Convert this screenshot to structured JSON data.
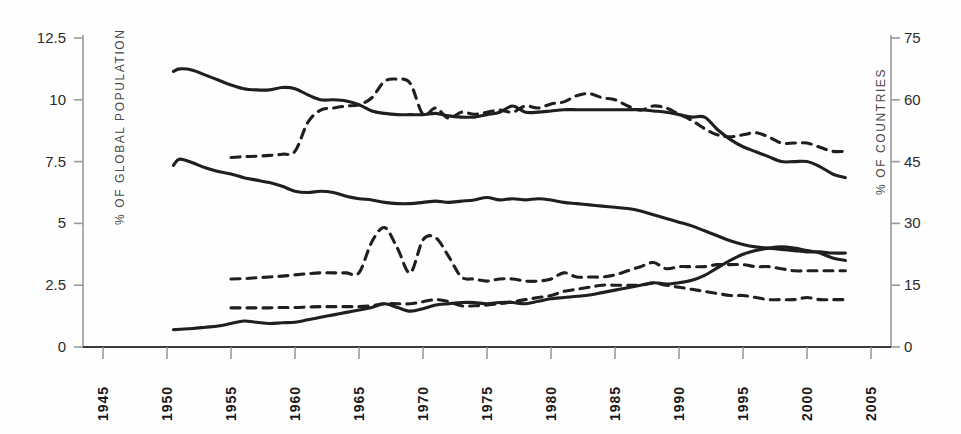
{
  "chart_data": {
    "type": "line",
    "title": "",
    "xlabel": "",
    "ylabel": "% OF GLOBAL POPULATION",
    "y2label": "% OF COUNTRIES",
    "xlim": [
      1945,
      2005
    ],
    "ylim": [
      0,
      12.5
    ],
    "y2lim": [
      0,
      75
    ],
    "grid": false,
    "legend": "none",
    "xticks": [
      "1945",
      "1950",
      "1955",
      "1960",
      "1965",
      "1970",
      "1975",
      "1980",
      "1985",
      "1990",
      "1995",
      "2000",
      "2005"
    ],
    "yticks_left": [
      "0",
      "2.5",
      "5",
      "7.5",
      "10",
      "12.5"
    ],
    "yticks_right": [
      "0",
      "15",
      "30",
      "45",
      "60",
      "75"
    ],
    "line_color": "#1f1f1f",
    "axis_color": "#9a9a9a",
    "series": [
      {
        "name": "population-upper-solid",
        "axis": "left",
        "style": "solid",
        "x": [
          1950.5,
          1951,
          1952,
          1953,
          1954,
          1955,
          1956,
          1957,
          1958,
          1959,
          1960,
          1961,
          1962,
          1963,
          1964,
          1965,
          1966,
          1967,
          1968,
          1969,
          1970,
          1971,
          1972,
          1973,
          1974,
          1975,
          1976,
          1977,
          1978,
          1979,
          1980,
          1981,
          1982,
          1983,
          1984,
          1985,
          1986,
          1987,
          1988,
          1989,
          1990,
          1991,
          1992,
          1993,
          1994,
          1995,
          1996,
          1997,
          1998,
          1999,
          2000,
          2001,
          2002,
          2003
        ],
        "values": [
          11.15,
          11.25,
          11.2,
          11.0,
          10.8,
          10.6,
          10.45,
          10.4,
          10.4,
          10.5,
          10.45,
          10.2,
          10.0,
          10.0,
          9.95,
          9.8,
          9.55,
          9.45,
          9.4,
          9.4,
          9.4,
          9.45,
          9.35,
          9.3,
          9.3,
          9.4,
          9.5,
          9.75,
          9.5,
          9.5,
          9.55,
          9.6,
          9.6,
          9.6,
          9.6,
          9.6,
          9.6,
          9.6,
          9.55,
          9.5,
          9.4,
          9.3,
          9.3,
          8.8,
          8.4,
          8.1,
          7.9,
          7.7,
          7.5,
          7.5,
          7.5,
          7.3,
          7.0,
          6.85
        ]
      },
      {
        "name": "population-middle-solid",
        "axis": "left",
        "style": "solid",
        "x": [
          1950.5,
          1951,
          1952,
          1953,
          1954,
          1955,
          1956,
          1957,
          1958,
          1959,
          1960,
          1961,
          1962,
          1963,
          1964,
          1965,
          1966,
          1967,
          1968,
          1969,
          1970,
          1971,
          1972,
          1973,
          1974,
          1975,
          1976,
          1977,
          1978,
          1979,
          1980,
          1981,
          1982,
          1983,
          1984,
          1985,
          1986,
          1987,
          1988,
          1989,
          1990,
          1991,
          1992,
          1993,
          1994,
          1995,
          1996,
          1997,
          1998,
          1999,
          2000,
          2001,
          2002,
          2003
        ],
        "values": [
          7.35,
          7.6,
          7.45,
          7.25,
          7.1,
          7.0,
          6.85,
          6.75,
          6.65,
          6.5,
          6.3,
          6.25,
          6.3,
          6.25,
          6.1,
          6.0,
          5.95,
          5.85,
          5.8,
          5.8,
          5.85,
          5.9,
          5.85,
          5.9,
          5.95,
          6.05,
          5.95,
          6.0,
          5.95,
          6.0,
          5.95,
          5.85,
          5.8,
          5.75,
          5.7,
          5.65,
          5.6,
          5.5,
          5.35,
          5.2,
          5.05,
          4.9,
          4.7,
          4.5,
          4.3,
          4.15,
          4.05,
          4.0,
          3.95,
          3.9,
          3.85,
          3.85,
          3.8,
          3.8
        ]
      },
      {
        "name": "population-lower-solid",
        "axis": "left",
        "style": "solid",
        "x": [
          1950.5,
          1951,
          1952,
          1953,
          1954,
          1955,
          1956,
          1957,
          1958,
          1959,
          1960,
          1961,
          1962,
          1963,
          1964,
          1965,
          1966,
          1967,
          1968,
          1969,
          1970,
          1971,
          1972,
          1973,
          1974,
          1975,
          1976,
          1977,
          1978,
          1979,
          1980,
          1981,
          1982,
          1983,
          1984,
          1985,
          1986,
          1987,
          1988,
          1989,
          1990,
          1991,
          1992,
          1993,
          1994,
          1995,
          1996,
          1997,
          1998,
          1999,
          2000,
          2001,
          2002,
          2003
        ],
        "values": [
          0.7,
          0.72,
          0.75,
          0.8,
          0.85,
          0.95,
          1.05,
          1.0,
          0.95,
          0.98,
          1.0,
          1.1,
          1.2,
          1.3,
          1.4,
          1.5,
          1.6,
          1.75,
          1.6,
          1.45,
          1.55,
          1.7,
          1.75,
          1.8,
          1.8,
          1.75,
          1.8,
          1.8,
          1.75,
          1.85,
          1.95,
          2.0,
          2.05,
          2.1,
          2.2,
          2.3,
          2.4,
          2.5,
          2.6,
          2.55,
          2.6,
          2.7,
          2.9,
          3.2,
          3.5,
          3.75,
          3.9,
          4.0,
          4.05,
          4.0,
          3.9,
          3.8,
          3.6,
          3.5
        ]
      },
      {
        "name": "countries-upper-dashed",
        "axis": "right",
        "style": "dashed",
        "x": [
          1955,
          1956,
          1957,
          1958,
          1959,
          1960,
          1961,
          1962,
          1963,
          1964,
          1965,
          1966,
          1967,
          1968,
          1969,
          1970,
          1971,
          1972,
          1973,
          1974,
          1975,
          1976,
          1977,
          1978,
          1979,
          1980,
          1981,
          1982,
          1983,
          1984,
          1985,
          1986,
          1987,
          1988,
          1989,
          1990,
          1991,
          1992,
          1993,
          1994,
          1995,
          1996,
          1997,
          1998,
          1999,
          2000,
          2001,
          2002,
          2003
        ],
        "values": [
          46.0,
          46.2,
          46.3,
          46.5,
          46.8,
          47.5,
          54.5,
          57.5,
          58.0,
          58.5,
          58.8,
          60.5,
          64.5,
          65.0,
          64.0,
          56.5,
          58.0,
          55.5,
          57.0,
          56.5,
          57.0,
          57.5,
          57.0,
          58.5,
          58.0,
          59.0,
          59.5,
          61.0,
          61.5,
          60.5,
          60.0,
          58.5,
          57.5,
          58.5,
          58.0,
          56.5,
          55.0,
          53.0,
          51.5,
          51.0,
          51.5,
          52.0,
          51.0,
          49.5,
          49.5,
          49.5,
          48.5,
          47.5,
          47.5
        ]
      },
      {
        "name": "countries-middle-dashed",
        "axis": "right",
        "style": "dashed",
        "x": [
          1955,
          1956,
          1957,
          1958,
          1959,
          1960,
          1961,
          1962,
          1963,
          1964,
          1965,
          1966,
          1967,
          1968,
          1969,
          1970,
          1971,
          1972,
          1973,
          1974,
          1975,
          1976,
          1977,
          1978,
          1979,
          1980,
          1981,
          1982,
          1983,
          1984,
          1985,
          1986,
          1987,
          1988,
          1989,
          1990,
          1991,
          1992,
          1993,
          1994,
          1995,
          1996,
          1997,
          1998,
          1999,
          2000,
          2001,
          2002,
          2003
        ],
        "values": [
          16.5,
          16.6,
          16.8,
          17.0,
          17.2,
          17.5,
          17.8,
          18.0,
          18.0,
          18.0,
          18.0,
          25.5,
          29.0,
          24.0,
          18.0,
          26.0,
          26.5,
          22.0,
          17.0,
          16.5,
          16.0,
          16.5,
          16.5,
          16.0,
          16.0,
          16.5,
          18.0,
          17.0,
          17.0,
          17.0,
          17.5,
          18.5,
          19.5,
          20.5,
          19.0,
          19.5,
          19.5,
          19.5,
          20.0,
          20.0,
          20.0,
          19.5,
          19.5,
          19.0,
          18.5,
          18.5,
          18.5,
          18.5,
          18.5
        ]
      },
      {
        "name": "countries-lower-dashed",
        "axis": "right",
        "style": "dashed",
        "x": [
          1955,
          1956,
          1957,
          1958,
          1959,
          1960,
          1961,
          1962,
          1963,
          1964,
          1965,
          1966,
          1967,
          1968,
          1969,
          1970,
          1971,
          1972,
          1973,
          1974,
          1975,
          1976,
          1977,
          1978,
          1979,
          1980,
          1981,
          1982,
          1983,
          1984,
          1985,
          1986,
          1987,
          1988,
          1989,
          1990,
          1991,
          1992,
          1993,
          1994,
          1995,
          1996,
          1997,
          1998,
          1999,
          2000,
          2001,
          2002,
          2003
        ],
        "values": [
          9.5,
          9.5,
          9.5,
          9.5,
          9.6,
          9.6,
          9.7,
          9.8,
          9.8,
          9.8,
          9.8,
          10.0,
          10.5,
          10.5,
          10.5,
          11.0,
          11.5,
          11.0,
          10.0,
          10.0,
          10.2,
          10.5,
          11.0,
          11.5,
          12.0,
          12.5,
          13.5,
          14.0,
          14.5,
          15.0,
          15.0,
          15.0,
          15.0,
          15.5,
          15.0,
          14.5,
          14.0,
          13.5,
          13.0,
          12.5,
          12.5,
          12.0,
          11.5,
          11.5,
          11.5,
          12.0,
          11.5,
          11.5,
          11.5
        ]
      }
    ]
  }
}
